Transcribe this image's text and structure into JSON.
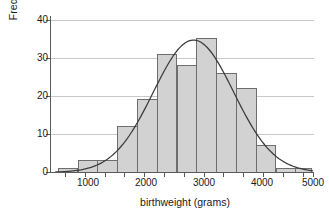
{
  "chart_data": {
    "type": "bar",
    "title": "",
    "subtitle": "",
    "xlabel": "birthweight (grams)",
    "ylabel": "Frequency",
    "xlim": [
      600,
      5050
    ],
    "ylim": [
      0,
      41
    ],
    "xticks": [
      1000,
      2000,
      3000,
      4000,
      5000
    ],
    "xtick_labels": [
      "1000",
      "2000",
      "3000",
      "4000",
      "5000"
    ],
    "yticks": [
      0,
      10,
      20,
      30,
      40
    ],
    "ytick_labels": [
      "0",
      "10",
      "20",
      "30",
      "40"
    ],
    "grid": "horizontal",
    "legend": "none",
    "bin_width": 340,
    "bin_edges": [
      650,
      990,
      1330,
      1670,
      2010,
      2350,
      2690,
      3030,
      3370,
      3710,
      4050,
      4390,
      4730,
      5010
    ],
    "categories": [
      "650-990",
      "990-1330",
      "1330-1670",
      "1670-2010",
      "2010-2350",
      "2350-2690",
      "2690-3030",
      "3030-3370",
      "3370-3710",
      "3710-4050",
      "4050-4390",
      "4390-4730",
      "4730-5010"
    ],
    "values": [
      1,
      3,
      3,
      12,
      19,
      31,
      28,
      35,
      26,
      22,
      7,
      1,
      1
    ],
    "overlay": {
      "type": "line",
      "name": "normal-density-curve",
      "peak_x": 2980,
      "peak_y": 34.7,
      "mean": 2980,
      "sd": 690,
      "color": "#3a3a3a"
    },
    "colors": {
      "bar_fill": "#d2d2d2",
      "bar_stroke": "#6e6e6e",
      "axis": "#5a5a5a",
      "grid": "#c9c9c9",
      "curve": "#3a3a3a",
      "text": "#1a1a1a"
    }
  }
}
